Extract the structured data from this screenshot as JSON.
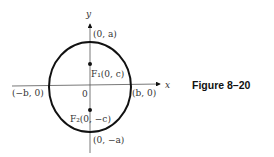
{
  "figure": {
    "caption": "Figure 8–20",
    "axes": {
      "x_label": "x",
      "y_label": "y",
      "origin_label": "0"
    },
    "ellipse": {
      "center": "(0, 0)",
      "stroke_color": "#111111"
    },
    "points": {
      "top_vertex": "(0, a)",
      "bottom_vertex": "(0, −a)",
      "left_vertex": "(−b, 0)",
      "right_vertex": "(b, 0)",
      "focus_1": "F₁(0, c)",
      "focus_2": "F₂(0, −c)"
    }
  }
}
